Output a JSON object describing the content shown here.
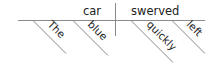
{
  "diagram": {
    "type": "sentence-diagram",
    "subject": "car",
    "predicate": "swerved",
    "subject_modifiers": [
      "The",
      "blue"
    ],
    "predicate_modifiers": [
      "quickly",
      "left"
    ],
    "line_color": "#8a8a8a",
    "text_color": "#222222"
  }
}
